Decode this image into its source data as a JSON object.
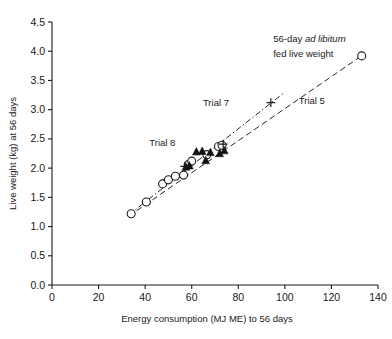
{
  "chart_data": {
    "type": "scatter",
    "title": "",
    "xlabel": "Energy consumption (MJ ME) to 56 days",
    "ylabel": "Live weight (kg) at 56 days",
    "xlim": [
      0,
      140
    ],
    "ylim": [
      0.0,
      4.5
    ],
    "xticks": [
      "0",
      "20",
      "40",
      "60",
      "80",
      "100",
      "120",
      "140"
    ],
    "xtick_values": [
      0,
      20,
      40,
      60,
      80,
      100,
      120,
      140
    ],
    "yticks": [
      "0.0",
      "0.5",
      "1.0",
      "1.5",
      "2.0",
      "2.5",
      "3.0",
      "3.5",
      "4.0",
      "4.5"
    ],
    "ytick_values": [
      0.0,
      0.5,
      1.0,
      1.5,
      2.0,
      2.5,
      3.0,
      3.5,
      4.0,
      4.5
    ],
    "grid": false,
    "legend": "none",
    "series": [
      {
        "name": "open-circle",
        "marker": "open-circle",
        "color": "#1a1a1a",
        "points": [
          [
            34.0,
            1.22
          ],
          [
            40.5,
            1.42
          ],
          [
            47.5,
            1.73
          ],
          [
            50.0,
            1.8
          ],
          [
            53.0,
            1.86
          ],
          [
            56.5,
            1.88
          ],
          [
            58.5,
            2.06
          ],
          [
            60.0,
            2.12
          ],
          [
            66.5,
            2.23
          ],
          [
            71.5,
            2.37
          ],
          [
            73.0,
            2.39
          ],
          [
            133.0,
            3.92
          ]
        ]
      },
      {
        "name": "filled-triangle",
        "marker": "filled-triangle",
        "color": "#111111",
        "points": [
          [
            57.5,
            2.02
          ],
          [
            59.0,
            2.04
          ],
          [
            62.0,
            2.28
          ],
          [
            64.5,
            2.29
          ],
          [
            66.0,
            2.13
          ],
          [
            68.0,
            2.27
          ],
          [
            72.0,
            2.25
          ],
          [
            74.0,
            2.3
          ]
        ]
      },
      {
        "name": "plus",
        "marker": "plus",
        "color": "#1a1a1a",
        "points": [
          [
            57.0,
            2.03
          ],
          [
            73.5,
            2.41
          ],
          [
            94.0,
            3.12
          ]
        ]
      }
    ],
    "trend_lines": [
      {
        "name": "Trial 7",
        "style": "dash-dot",
        "x": [
          33.0,
          100.0
        ],
        "y": [
          1.2,
          3.3
        ]
      },
      {
        "name": "Trial 5",
        "style": "dashed",
        "x": [
          33.0,
          134.0
        ],
        "y": [
          1.18,
          3.95
        ]
      }
    ],
    "annotations": [
      {
        "name": "ad-libitum-note-line1",
        "text": "56-day ",
        "italic_text": "ad libitum",
        "x": 95,
        "y": 4.15
      },
      {
        "name": "ad-libitum-note-line2",
        "text": "fed live weight",
        "x": 95,
        "y": 3.92
      },
      {
        "name": "trial-5-label",
        "text": "Trial 5",
        "x": 108,
        "y": 3.15
      },
      {
        "name": "trial-7-label",
        "text": "Trial 7",
        "x": 78,
        "y": 3.12
      },
      {
        "name": "trial-8-label",
        "text": "Trial 8",
        "x": 47,
        "y": 2.4
      }
    ]
  },
  "labels": {
    "ad_libitum_prefix": "56-day ",
    "ad_libitum_italic": "ad libitum",
    "ad_libitum_line2": "fed live weight",
    "trial5": "Trial 5",
    "trial7": "Trial 7",
    "trial8": "Trial 8",
    "xlabel": "Energy consumption (MJ ME) to 56 days",
    "ylabel": "Live weight (kg) at 56 days"
  }
}
